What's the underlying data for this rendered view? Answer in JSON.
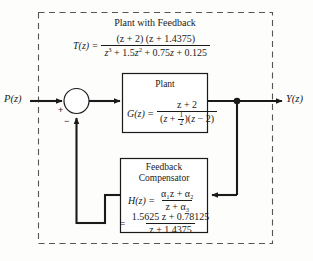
{
  "diagram": {
    "type": "control-system-block-diagram",
    "outer_group_label": "Plant with Feedback",
    "input_label": "P(z)",
    "output_label": "Y(z)",
    "summing_junction": {
      "input_sign": "+",
      "feedback_sign": "−"
    },
    "overall_transfer_function": {
      "lhs": "T(z) =",
      "numerator": "(z + 2) (z + 1.4375)",
      "denominator": "z³ + 1.5z² + 0.75z + 0.125"
    },
    "plant_block": {
      "title": "Plant",
      "lhs": "G(z) =",
      "numerator": "z + 2",
      "denominator_prefix": "(z + ",
      "denominator_frac_num": "1",
      "denominator_frac_den": "2",
      "denominator_suffix": ")(z − 2)"
    },
    "feedback_block": {
      "title_line1": "Feedback",
      "title_line2": "Compensator",
      "lhs": "H(z) =",
      "symbolic_numerator": "α₁z + α₂",
      "symbolic_denominator": "z + α₃",
      "equals": "=",
      "numeric_numerator": "1.5625 z + 0.78125",
      "numeric_denominator": "z + 1.4375"
    },
    "colors": {
      "line": "#1a1a1a",
      "dashed_border": "#555555",
      "background": "#fdfdfc"
    }
  }
}
